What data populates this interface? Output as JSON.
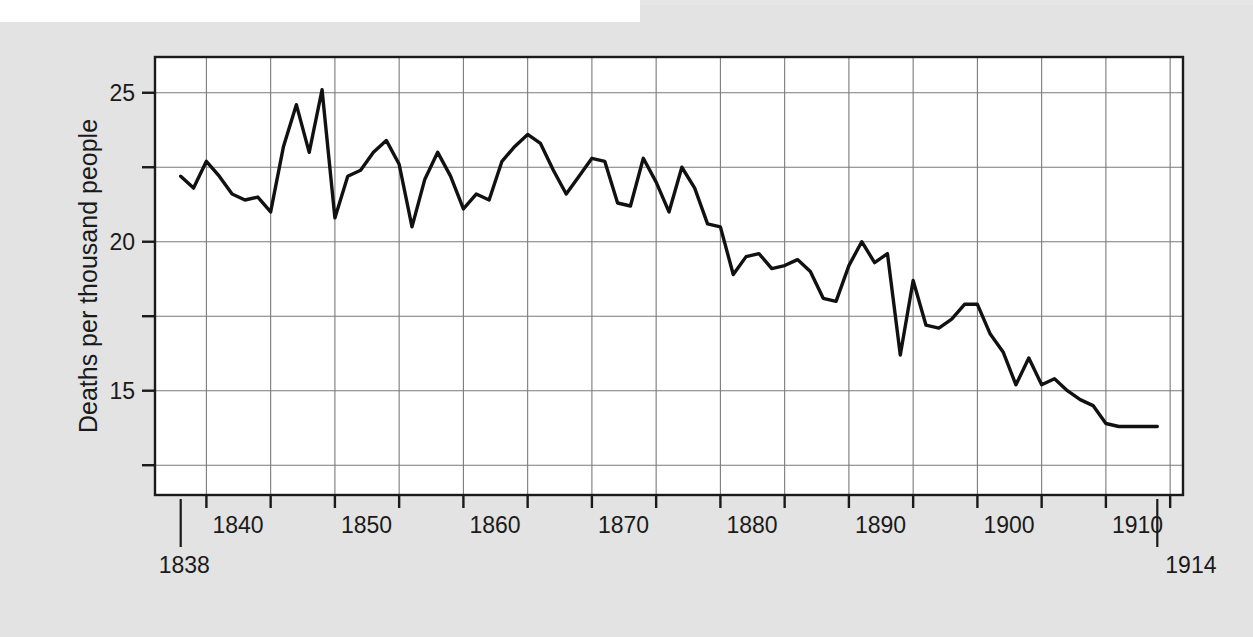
{
  "figure": {
    "background_color": "#e3e3e3",
    "plot_background_color": "#ffffff",
    "axis_color": "#1a1a1a",
    "grid_color": "#7a7a7a",
    "line_color": "#111111"
  },
  "chart_data": {
    "type": "line",
    "title": "",
    "xlabel": "",
    "ylabel": "Deaths per thousand people",
    "xlim": [
      1836,
      1916
    ],
    "ylim": [
      11.5,
      26.2
    ],
    "grid": true,
    "legend": null,
    "x_tick_labels": [
      "1840",
      "1850",
      "1860",
      "1870",
      "1880",
      "1890",
      "1900",
      "1910"
    ],
    "x_tick_values": [
      1840,
      1850,
      1860,
      1870,
      1880,
      1890,
      1900,
      1910
    ],
    "x_minor_tick_values": [
      1845,
      1855,
      1865,
      1875,
      1885,
      1895,
      1905,
      1915
    ],
    "y_tick_labels": [
      "25",
      "20",
      "15"
    ],
    "y_tick_values": [
      25,
      20,
      15
    ],
    "y_minor_tick_values": [
      22.5,
      17.5,
      12.5
    ],
    "y_gridline_values": [
      25,
      22.5,
      20,
      17.5,
      15,
      12.5
    ],
    "endpoint_annotations": [
      {
        "label": "1838",
        "x": 1838,
        "side": "left"
      },
      {
        "label": "1914",
        "x": 1914,
        "side": "right"
      }
    ],
    "series": [
      {
        "name": "Crude death rate, England and Wales",
        "x": [
          1838,
          1839,
          1840,
          1841,
          1842,
          1843,
          1844,
          1845,
          1846,
          1847,
          1848,
          1849,
          1850,
          1851,
          1852,
          1853,
          1854,
          1855,
          1856,
          1857,
          1858,
          1859,
          1860,
          1861,
          1862,
          1863,
          1864,
          1865,
          1866,
          1867,
          1868,
          1869,
          1870,
          1871,
          1872,
          1873,
          1874,
          1875,
          1876,
          1877,
          1878,
          1879,
          1880,
          1881,
          1882,
          1883,
          1884,
          1885,
          1886,
          1887,
          1888,
          1889,
          1890,
          1891,
          1892,
          1893,
          1894,
          1895,
          1896,
          1897,
          1898,
          1899,
          1900,
          1901,
          1902,
          1903,
          1904,
          1905,
          1906,
          1907,
          1908,
          1909,
          1910,
          1911,
          1912,
          1913,
          1914
        ],
        "y": [
          22.2,
          21.8,
          22.7,
          22.2,
          21.6,
          21.4,
          21.5,
          21.0,
          23.2,
          24.6,
          23.0,
          25.1,
          20.8,
          22.2,
          22.4,
          23.0,
          23.4,
          22.6,
          20.5,
          22.1,
          23.0,
          22.2,
          21.1,
          21.6,
          21.4,
          22.7,
          23.2,
          23.6,
          23.3,
          22.4,
          21.6,
          22.2,
          22.8,
          22.7,
          21.3,
          21.2,
          22.8,
          22.0,
          21.0,
          22.5,
          21.8,
          20.6,
          20.5,
          18.9,
          19.5,
          19.6,
          19.1,
          19.2,
          19.4,
          19.0,
          18.1,
          18.0,
          19.2,
          20.0,
          19.3,
          19.6,
          16.2,
          18.7,
          17.2,
          17.1,
          17.4,
          17.9,
          17.9,
          16.9,
          16.3,
          15.2,
          16.1,
          15.2,
          15.4,
          15.0,
          14.7,
          14.5,
          13.9,
          13.8,
          13.8,
          13.8,
          13.8
        ]
      }
    ]
  }
}
